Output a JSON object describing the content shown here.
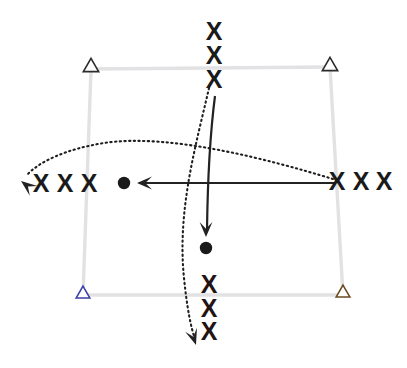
{
  "diagram": {
    "type": "play-diagram",
    "canvas": {
      "width": 407,
      "height": 368,
      "background": "#ffffff"
    },
    "colors": {
      "court_line": "#e2e2e4",
      "marker": "#1a1a1a",
      "arrow": "#222222",
      "dotted": "#1f1f1f",
      "corner_top_left": "#2b2b2b",
      "corner_top_right": "#2b2b2b",
      "corner_bottom_left": "#3b3fa8",
      "corner_bottom_right": "#6b4a22"
    },
    "court": {
      "label": "court-boundary",
      "corners": [
        {
          "name": "top-left",
          "x": 91,
          "y": 69
        },
        {
          "name": "top-right",
          "x": 330,
          "y": 67
        },
        {
          "name": "bottom-right",
          "x": 343,
          "y": 295
        },
        {
          "name": "bottom-left",
          "x": 83,
          "y": 295
        }
      ]
    },
    "corner_markers": [
      {
        "name": "corner-marker-top-left",
        "glyph": "triangle",
        "x": 91,
        "y": 66,
        "size": 9,
        "stroke": "#2b2b2b"
      },
      {
        "name": "corner-marker-top-right",
        "glyph": "triangle",
        "x": 330,
        "y": 65,
        "size": 9,
        "stroke": "#2b2b2b"
      },
      {
        "name": "corner-marker-bottom-left",
        "glyph": "triangle",
        "x": 83,
        "y": 293,
        "size": 8,
        "stroke": "#3b3fa8"
      },
      {
        "name": "corner-marker-bottom-right",
        "glyph": "triangle",
        "x": 343,
        "y": 292,
        "size": 8,
        "stroke": "#6b4a22"
      }
    ],
    "x_markers": {
      "label": "x-marker",
      "glyph": "X",
      "groups": [
        {
          "name": "x-group-top",
          "positions": [
            {
              "x": 214,
              "y": 31
            },
            {
              "x": 214,
              "y": 55
            },
            {
              "x": 214,
              "y": 79
            }
          ]
        },
        {
          "name": "x-group-left",
          "positions": [
            {
              "x": 41,
              "y": 183
            },
            {
              "x": 65,
              "y": 183
            },
            {
              "x": 89,
              "y": 183
            }
          ]
        },
        {
          "name": "x-group-right",
          "positions": [
            {
              "x": 337,
              "y": 181
            },
            {
              "x": 361,
              "y": 181
            },
            {
              "x": 384,
              "y": 181
            }
          ]
        },
        {
          "name": "x-group-bottom",
          "positions": [
            {
              "x": 209,
              "y": 284
            },
            {
              "x": 209,
              "y": 308
            },
            {
              "x": 209,
              "y": 331
            }
          ]
        }
      ]
    },
    "dots": [
      {
        "name": "player-dot-left",
        "x": 124,
        "y": 183,
        "r": 6.2
      },
      {
        "name": "player-dot-center",
        "x": 206,
        "y": 248,
        "r": 6.2
      }
    ],
    "solid_arrows": [
      {
        "name": "arrow-horizontal-leftward",
        "path": "M 336 183 L 139 183",
        "head": {
          "x": 137,
          "y": 183,
          "angle": 180
        }
      },
      {
        "name": "arrow-vertical-downward",
        "path": "M 215 96 Q 208 150 207 231",
        "head": {
          "x": 206,
          "y": 237,
          "angle": 90
        }
      }
    ],
    "dotted_arrows": [
      {
        "name": "dotted-arc-horizontal",
        "path": "M 333 179 C 270 160 170 133 104 143 C 66 149 38 162 26 176",
        "head": {
          "x": 21,
          "y": 181,
          "angle": 218
        }
      },
      {
        "name": "dotted-arc-vertical",
        "path": "M 209 88 C 196 145 177 210 184 278 C 187 308 191 328 195 339",
        "head": {
          "x": 196,
          "y": 345,
          "angle": 72
        }
      }
    ]
  }
}
